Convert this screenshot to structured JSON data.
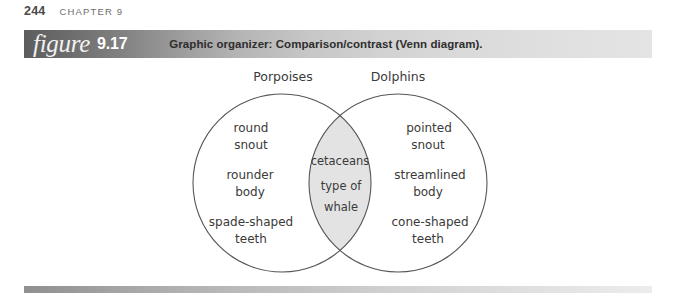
{
  "running_head": {
    "page_number": "244",
    "chapter": "CHAPTER 9"
  },
  "figure": {
    "word": "figure",
    "number": "9.17",
    "caption": "Graphic organizer: Comparison/contrast (Venn diagram)."
  },
  "venn": {
    "left_label": "Porpoises",
    "right_label": "Dolphins",
    "left_items": [
      "round",
      "snout",
      "rounder",
      "body",
      "spade-shaped",
      "teeth"
    ],
    "right_items": [
      "pointed",
      "snout",
      "streamlined",
      "body",
      "cone-shaped",
      "teeth"
    ],
    "center_items": [
      "cetaceans",
      "type of",
      "whale"
    ],
    "stroke_color": "#555555",
    "intersection_fill": "#e3e3e3"
  }
}
